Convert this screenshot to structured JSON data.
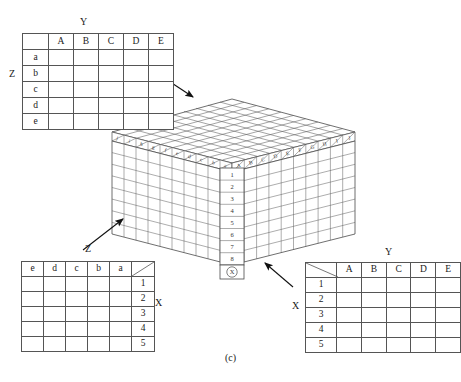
{
  "figure": {
    "caption": "(c)"
  },
  "tables": {
    "top_left": {
      "name": "YZ projection table",
      "col_axis_label": "Y",
      "row_axis_label": "Z",
      "corner": "",
      "columns": [
        "A",
        "B",
        "C",
        "D",
        "E"
      ],
      "rows": [
        "a",
        "b",
        "c",
        "d",
        "e"
      ],
      "cells": [
        [
          "",
          "",
          "",
          "",
          ""
        ],
        [
          "",
          "",
          "",
          "",
          ""
        ],
        [
          "",
          "",
          "",
          "",
          ""
        ],
        [
          "",
          "",
          "",
          "",
          ""
        ],
        [
          "",
          "",
          "",
          "",
          ""
        ]
      ]
    },
    "bottom_left": {
      "name": "ZX projection table",
      "col_axis_label": "Z",
      "row_axis_label": "X",
      "columns": [
        "e",
        "d",
        "c",
        "b",
        "a"
      ],
      "corner": "",
      "rows": [
        "1",
        "2",
        "3",
        "4",
        "5"
      ],
      "cells": [
        [
          "",
          "",
          "",
          "",
          ""
        ],
        [
          "",
          "",
          "",
          "",
          ""
        ],
        [
          "",
          "",
          "",
          "",
          ""
        ],
        [
          "",
          "",
          "",
          "",
          ""
        ],
        [
          "",
          "",
          "",
          "",
          ""
        ]
      ]
    },
    "bottom_right": {
      "name": "XY projection table",
      "col_axis_label": "Y",
      "row_axis_label": "X",
      "corner": "",
      "columns": [
        "A",
        "B",
        "C",
        "D",
        "E"
      ],
      "rows": [
        "1",
        "2",
        "3",
        "4",
        "5"
      ],
      "cells": [
        [
          "",
          "",
          "",
          "",
          ""
        ],
        [
          "",
          "",
          "",
          "",
          ""
        ],
        [
          "",
          "",
          "",
          "",
          ""
        ],
        [
          "",
          "",
          "",
          "",
          ""
        ],
        [
          "",
          "",
          "",
          "",
          ""
        ]
      ]
    }
  },
  "cube": {
    "name": "data-cube",
    "left_face_tabs": [
      "j",
      "i",
      "h",
      "g",
      "f",
      "e",
      "d",
      "c",
      "b",
      "a"
    ],
    "right_face_tabs": [
      "A",
      "B",
      "C",
      "D",
      "E",
      "F",
      "G",
      "H",
      "I",
      "J"
    ],
    "front_column_numbers": [
      "1",
      "2",
      "3",
      "4",
      "5",
      "6",
      "7",
      "8"
    ],
    "front_column_marker": "X",
    "left_face_columns": 10,
    "right_face_columns": 10,
    "face_rows": 8,
    "top_face_grid": "10 x 10",
    "colors": {
      "line": "#4a4a4a",
      "fill": "#ffffff",
      "top_fill": "#fdfdfd"
    }
  },
  "arrows": [
    {
      "name": "arrow-top-table-to-cube-top",
      "from": "top_left_table",
      "to": "cube_top_face"
    },
    {
      "name": "arrow-bottom-left-table-to-cube-left",
      "from": "bottom_left_table",
      "to": "cube_left_face",
      "label": "Z"
    },
    {
      "name": "arrow-bottom-right-table-to-cube-right",
      "from": "bottom_right_table",
      "to": "cube_right_face"
    }
  ]
}
